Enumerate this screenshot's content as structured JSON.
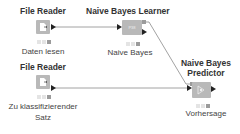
{
  "workflow": {
    "nodes": [
      {
        "id": "file-reader-1",
        "title": "File Reader",
        "label": "Daten lesen",
        "icon": "file-reader-icon"
      },
      {
        "id": "nb-learner",
        "title": "Naive Bayes Learner",
        "label": "Naive Bayes",
        "icon": "learner-icon",
        "glyph": "P38"
      },
      {
        "id": "nb-predictor",
        "title_line1": "Naive Bayes",
        "title_line2": "Predictor",
        "label": "Vorhersage",
        "icon": "predictor-icon"
      },
      {
        "id": "file-reader-2",
        "title": "File Reader",
        "label_line1": "Zu klassifizierender",
        "label_line2": "Satz",
        "icon": "file-reader-icon"
      }
    ],
    "colors": {
      "node_fill": "#b9b9b9",
      "link": "#8a8a8a",
      "arrow": "#222222"
    }
  }
}
